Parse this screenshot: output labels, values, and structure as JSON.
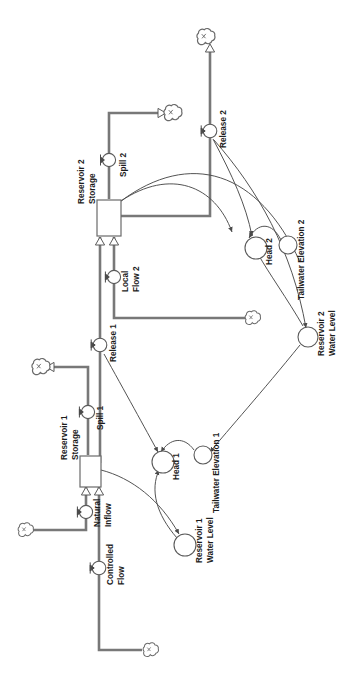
{
  "diagram": {
    "orientation_degrees": 90,
    "background_color": "#ffffff",
    "line_color": "#5a5a5a",
    "thick_line_color": "#6e6e6e",
    "text_color": "#1c1c1c",
    "stocks": [
      {
        "id": "res2_storage",
        "label": "Reservoir 2\nStorage",
        "label_line1": "Reservoir 2",
        "label_line2": "Storage"
      },
      {
        "id": "res1_storage",
        "label": "Reservoir 1\nStorage",
        "label_line1": "Reservoir 1",
        "label_line2": "Storage"
      }
    ],
    "flows": [
      {
        "id": "spill2",
        "label": "Spill 2"
      },
      {
        "id": "release2",
        "label": "Release 2"
      },
      {
        "id": "local_flow2",
        "label_line1": "Local",
        "label_line2": "Flow 2"
      },
      {
        "id": "release1",
        "label": "Release 1"
      },
      {
        "id": "spill1",
        "label": "Spill 1"
      },
      {
        "id": "natural_inflow",
        "label_line1": "Natural",
        "label_line2": "Inflow"
      },
      {
        "id": "controlled_flow",
        "label_line1": "Controlled",
        "label_line2": "Flow"
      }
    ],
    "auxiliaries": [
      {
        "id": "head2",
        "label": "Head 2"
      },
      {
        "id": "tailwater2",
        "label": "Tailwater Elevation 2"
      },
      {
        "id": "res2_water_level",
        "label_line1": "Reservoir 2",
        "label_line2": "Water Level"
      },
      {
        "id": "head1",
        "label": "Head 1"
      },
      {
        "id": "tailwater1",
        "label": "Tailwater Elevation 1"
      },
      {
        "id": "res1_water_level",
        "label_line1": "Reservoir 1",
        "label_line2": "Water Level"
      }
    ],
    "clouds": [
      {
        "id": "cloud_release2_sink"
      },
      {
        "id": "cloud_spill2_sink"
      },
      {
        "id": "cloud_local_flow2_source"
      },
      {
        "id": "cloud_spill1_sink"
      },
      {
        "id": "cloud_natural_inflow_source"
      },
      {
        "id": "cloud_controlled_flow_source"
      }
    ]
  }
}
